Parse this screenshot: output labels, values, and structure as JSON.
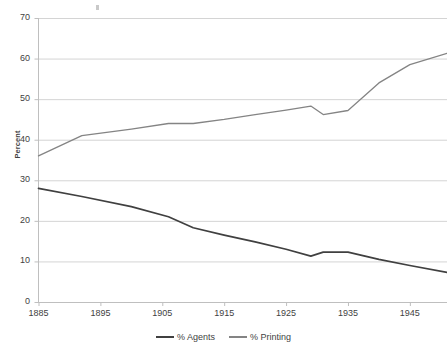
{
  "chart_data": {
    "type": "line",
    "title": "",
    "xlabel": "",
    "ylabel": "Percent",
    "xlim": [
      1885,
      1951
    ],
    "ylim": [
      0,
      70
    ],
    "grid": true,
    "legend_position": "bottom",
    "xticks": [
      "1885",
      "1895",
      "1905",
      "1915",
      "1925",
      "1935",
      "1945"
    ],
    "yticks": [
      "0",
      "10",
      "20",
      "30",
      "40",
      "50",
      "60",
      "70"
    ],
    "x": [
      1885,
      1892,
      1900,
      1906,
      1910,
      1915,
      1920,
      1925,
      1929,
      1931,
      1935,
      1940,
      1945,
      1951
    ],
    "series": [
      {
        "name": "% Agents",
        "color": "#404040",
        "values": [
          28.0,
          26.0,
          23.5,
          21.0,
          18.3,
          16.5,
          14.8,
          13.0,
          11.3,
          12.3,
          12.3,
          10.5,
          9.0,
          7.3
        ]
      },
      {
        "name": "% Printing",
        "color": "#848484",
        "values": [
          36.0,
          41.0,
          42.6,
          44.0,
          44.0,
          45.0,
          46.2,
          47.3,
          48.3,
          46.2,
          47.2,
          54.0,
          58.5,
          61.3
        ]
      }
    ]
  },
  "legend": {
    "items": [
      {
        "label": "% Agents",
        "color": "#404040"
      },
      {
        "label": "% Printing",
        "color": "#848484"
      }
    ]
  },
  "axis": {
    "y_title": "Percent"
  }
}
